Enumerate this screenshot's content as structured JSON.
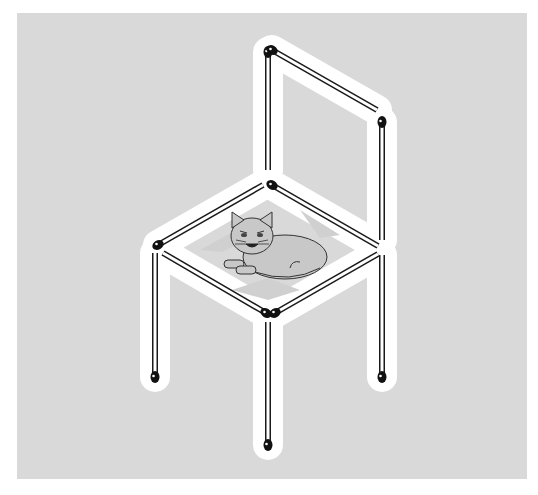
{
  "canvas": {
    "width": 538,
    "height": 495,
    "page_bg": "#ffffff"
  },
  "panel": {
    "x": 17,
    "y": 13,
    "width": 510,
    "height": 466,
    "color": "#d9d9d9"
  },
  "colors": {
    "halo": "#ffffff",
    "stick_fill": "#ffffff",
    "stick_outline": "#1a1a1a",
    "match_head": "#111111",
    "cat_fill": "#c8c8c8",
    "cat_outline": "#333333",
    "seat_shadow": "#d0d0d0"
  },
  "matchsticks": [
    {
      "name": "back-left-post",
      "x1": 268,
      "y1": 52,
      "x2": 268,
      "y2": 170,
      "head": "start"
    },
    {
      "name": "back-top-rail",
      "x1": 272,
      "y1": 50,
      "x2": 377,
      "y2": 110,
      "head": "start"
    },
    {
      "name": "back-right-post",
      "x1": 382,
      "y1": 122,
      "x2": 382,
      "y2": 240,
      "head": "start"
    },
    {
      "name": "seat-back-left",
      "x1": 158,
      "y1": 245,
      "x2": 263,
      "y2": 185,
      "head": "start"
    },
    {
      "name": "seat-back-right",
      "x1": 272,
      "y1": 185,
      "x2": 378,
      "y2": 246,
      "head": "start"
    },
    {
      "name": "seat-front-left",
      "x1": 163,
      "y1": 253,
      "x2": 266,
      "y2": 313,
      "head": "end"
    },
    {
      "name": "seat-front-right",
      "x1": 378,
      "y1": 254,
      "x2": 275,
      "y2": 313,
      "head": "end"
    },
    {
      "name": "front-left-leg",
      "x1": 155,
      "y1": 253,
      "x2": 155,
      "y2": 377,
      "head": "end"
    },
    {
      "name": "front-middle-leg",
      "x1": 268,
      "y1": 322,
      "x2": 268,
      "y2": 445,
      "head": "end"
    },
    {
      "name": "front-right-leg",
      "x1": 382,
      "y1": 255,
      "x2": 382,
      "y2": 377,
      "head": "end"
    }
  ],
  "cat": {
    "label": "cat",
    "cx": 275,
    "cy": 253
  }
}
